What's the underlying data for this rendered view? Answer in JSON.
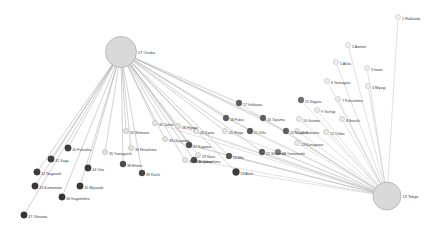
{
  "figure": {
    "type": "network-graph",
    "background_color": "#ffffff",
    "width": 440,
    "height": 231
  },
  "style": {
    "edge_color_osaka": "#9a9a9a",
    "edge_color_tokyo": "#bcbcbc",
    "hub_fill": "#d8d8d8",
    "hub_stroke": "#9b9b9b",
    "label_color": "#3a3a3a"
  },
  "hubs": [
    {
      "id": 27,
      "label": "27 Osaka",
      "x": 121,
      "y": 52,
      "r": 15.5,
      "fill": "#d9d9d9",
      "stroke": "#9e9e9e"
    },
    {
      "id": 13,
      "label": "13 Tokyo",
      "x": 387,
      "y": 196,
      "r": 14.0,
      "fill": "#d9d9d9",
      "stroke": "#9e9e9e"
    }
  ],
  "nodes": [
    {
      "id": 1,
      "label": "1 Hokkaido",
      "x": 398,
      "y": 17,
      "r": 2.6,
      "fill": "#f2f2f2",
      "stroke": "#b5b5b5",
      "label_dx": 4.0,
      "label_dy": 1.3
    },
    {
      "id": 2,
      "label": "2 Aomori",
      "x": 348,
      "y": 45,
      "r": 2.6,
      "fill": "#f0f0f0",
      "stroke": "#b2b2b2",
      "label_dx": 4.0,
      "label_dy": 1.3
    },
    {
      "id": 5,
      "label": "5 Akita",
      "x": 336,
      "y": 62,
      "r": 2.6,
      "fill": "#efefef",
      "stroke": "#b0b0b0",
      "label_dx": 4.0,
      "label_dy": 1.3
    },
    {
      "id": 3,
      "label": "3 Iwate",
      "x": 367,
      "y": 68,
      "r": 2.6,
      "fill": "#efefef",
      "stroke": "#b0b0b0",
      "label_dx": 4.0,
      "label_dy": 1.3
    },
    {
      "id": 6,
      "label": "6 Yamagata",
      "x": 327,
      "y": 81,
      "r": 2.6,
      "fill": "#ededed",
      "stroke": "#aeaeae",
      "label_dx": 4.0,
      "label_dy": 1.3
    },
    {
      "id": 4,
      "label": "4 Miyagi",
      "x": 368,
      "y": 86,
      "r": 2.6,
      "fill": "#ededed",
      "stroke": "#aeaeae",
      "label_dx": 4.0,
      "label_dy": 1.3
    },
    {
      "id": 15,
      "label": "15 Niigata",
      "x": 301,
      "y": 100,
      "r": 2.9,
      "fill": "#6e6e6e",
      "stroke": "#5d5d5d",
      "label_dx": 4.0,
      "label_dy": 1.3
    },
    {
      "id": 7,
      "label": "7 Fukushima",
      "x": 338,
      "y": 99,
      "r": 2.6,
      "fill": "#ececec",
      "stroke": "#adadad",
      "label_dx": 4.0,
      "label_dy": 1.3
    },
    {
      "id": 9,
      "label": "9 Tochigi",
      "x": 317,
      "y": 110,
      "r": 2.6,
      "fill": "#ebebeb",
      "stroke": "#acacac",
      "label_dx": 4.0,
      "label_dy": 1.3
    },
    {
      "id": 10,
      "label": "10 Gunma",
      "x": 299,
      "y": 119,
      "r": 2.6,
      "fill": "#eaeaea",
      "stroke": "#ababab",
      "label_dx": 4.0,
      "label_dy": 1.3
    },
    {
      "id": 8,
      "label": "8 Ibaraki",
      "x": 342,
      "y": 119,
      "r": 2.6,
      "fill": "#eaeaea",
      "stroke": "#ababab",
      "label_dx": 4.0,
      "label_dy": 1.3
    },
    {
      "id": 11,
      "label": "11 Saitama",
      "x": 297,
      "y": 131,
      "r": 2.6,
      "fill": "#e9e9e9",
      "stroke": "#aaaaaa",
      "label_dx": 4.0,
      "label_dy": 1.3
    },
    {
      "id": 12,
      "label": "12 Chiba",
      "x": 326,
      "y": 132,
      "r": 2.6,
      "fill": "#e9e9e9",
      "stroke": "#aaaaaa",
      "label_dx": 4.0,
      "label_dy": 1.3
    },
    {
      "id": 14,
      "label": "14 Kanagawa",
      "x": 297,
      "y": 143,
      "r": 2.6,
      "fill": "#e8e8e8",
      "stroke": "#a9a9a9",
      "label_dx": 4.0,
      "label_dy": 1.3
    },
    {
      "id": 19,
      "label": "19 Yamanashi",
      "x": 278,
      "y": 152,
      "r": 2.8,
      "fill": "#7a7a7a",
      "stroke": "#6a6a6a",
      "label_dx": 4.0,
      "label_dy": 1.3
    },
    {
      "id": 17,
      "label": "17 Ishikawa",
      "x": 239,
      "y": 103,
      "r": 2.9,
      "fill": "#5e5e5e",
      "stroke": "#4e4e4e",
      "label_dx": 4.0,
      "label_dy": 1.3
    },
    {
      "id": 16,
      "label": "16 Toyama",
      "x": 263,
      "y": 118,
      "r": 2.9,
      "fill": "#5f5f5f",
      "stroke": "#4f4f4f",
      "label_dx": 4.0,
      "label_dy": 1.3
    },
    {
      "id": 18,
      "label": "18 Fukui",
      "x": 226,
      "y": 118,
      "r": 2.9,
      "fill": "#5e5e5e",
      "stroke": "#4e4e4e",
      "label_dx": 4.0,
      "label_dy": 1.3
    },
    {
      "id": 20,
      "label": "20 Nagano",
      "x": 286,
      "y": 131,
      "r": 2.9,
      "fill": "#5f5f5f",
      "stroke": "#4f4f4f",
      "label_dx": 4.0,
      "label_dy": 1.3
    },
    {
      "id": 21,
      "label": "21 Gifu",
      "x": 250,
      "y": 131,
      "r": 2.9,
      "fill": "#585858",
      "stroke": "#484848",
      "label_dx": 4.0,
      "label_dy": 1.3
    },
    {
      "id": 25,
      "label": "25 Shiga",
      "x": 225,
      "y": 131,
      "r": 2.6,
      "fill": "#e6e6e6",
      "stroke": "#a6a6a6",
      "label_dx": 4.0,
      "label_dy": 1.3
    },
    {
      "id": 26,
      "label": "26 Kyoto",
      "x": 196,
      "y": 131,
      "r": 2.6,
      "fill": "#e6e6e6",
      "stroke": "#a6a6a6",
      "label_dx": 4.0,
      "label_dy": 1.3
    },
    {
      "id": 22,
      "label": "22 Shizuoka",
      "x": 262,
      "y": 152,
      "r": 2.9,
      "fill": "#5a5a5a",
      "stroke": "#4a4a4a",
      "label_dx": 4.0,
      "label_dy": 1.3
    },
    {
      "id": 29,
      "label": "29 Nara",
      "x": 198,
      "y": 155,
      "r": 2.6,
      "fill": "#e5e5e5",
      "stroke": "#a5a5a5",
      "label_dx": 4.0,
      "label_dy": 1.3
    },
    {
      "id": 24,
      "label": "24 Mie",
      "x": 229,
      "y": 156,
      "r": 2.9,
      "fill": "#565656",
      "stroke": "#464646",
      "label_dx": 4.0,
      "label_dy": 1.3
    },
    {
      "id": 23,
      "label": "23 Aichi",
      "x": 236,
      "y": 172,
      "r": 3.4,
      "fill": "#3d3d3d",
      "stroke": "#2d2d2d",
      "label_dx": 4.4,
      "label_dy": 1.3
    },
    {
      "id": 30,
      "label": "30 Wakayama",
      "x": 185,
      "y": 160,
      "r": 2.6,
      "fill": "#e4e4e4",
      "stroke": "#a4a4a4",
      "label_dx": 4.0,
      "label_dy": 1.3
    },
    {
      "id": 28,
      "label": "28 Hyogo",
      "x": 178,
      "y": 126,
      "r": 2.6,
      "fill": "#e4e4e4",
      "stroke": "#a4a4a4",
      "label_dx": 4.0,
      "label_dy": 1.3
    },
    {
      "id": 31,
      "label": "31 Tottori",
      "x": 155,
      "y": 123,
      "r": 2.6,
      "fill": "#e3e3e3",
      "stroke": "#a3a3a3",
      "label_dx": 4.0,
      "label_dy": 1.3
    },
    {
      "id": 33,
      "label": "33 Okayama",
      "x": 165,
      "y": 139,
      "r": 2.6,
      "fill": "#e3e3e3",
      "stroke": "#a3a3a3",
      "label_dx": 4.0,
      "label_dy": 1.3
    },
    {
      "id": 32,
      "label": "32 Shimane",
      "x": 126,
      "y": 131,
      "r": 2.6,
      "fill": "#e2e2e2",
      "stroke": "#a2a2a2",
      "label_dx": 4.0,
      "label_dy": 1.3
    },
    {
      "id": 34,
      "label": "34 Hiroshima",
      "x": 131,
      "y": 148,
      "r": 2.6,
      "fill": "#e2e2e2",
      "stroke": "#a2a2a2",
      "label_dx": 4.0,
      "label_dy": 1.3
    },
    {
      "id": 37,
      "label": "37 Kagawa",
      "x": 189,
      "y": 145,
      "r": 3.0,
      "fill": "#4d4d4d",
      "stroke": "#3d3d3d",
      "label_dx": 4.0,
      "label_dy": 1.3
    },
    {
      "id": 35,
      "label": "35 Yamaguchi",
      "x": 105,
      "y": 152,
      "r": 2.6,
      "fill": "#e1e1e1",
      "stroke": "#a1a1a1",
      "label_dx": 4.0,
      "label_dy": 1.3
    },
    {
      "id": 36,
      "label": "36 Tokushima",
      "x": 194,
      "y": 160,
      "r": 3.0,
      "fill": "#4a4a4a",
      "stroke": "#3a3a3a",
      "label_dx": 4.0,
      "label_dy": 1.3
    },
    {
      "id": 38,
      "label": "38 Ehime",
      "x": 123,
      "y": 164,
      "r": 3.0,
      "fill": "#4a4a4a",
      "stroke": "#3a3a3a",
      "label_dx": 4.0,
      "label_dy": 1.3
    },
    {
      "id": 39,
      "label": "39 Kochi",
      "x": 142,
      "y": 173,
      "r": 3.0,
      "fill": "#474747",
      "stroke": "#373737",
      "label_dx": 4.0,
      "label_dy": 1.3
    },
    {
      "id": 40,
      "label": "40 Fukuoka",
      "x": 68,
      "y": 148,
      "r": 3.2,
      "fill": "#3f3f3f",
      "stroke": "#2f2f2f",
      "label_dx": 4.2,
      "label_dy": 1.3
    },
    {
      "id": 41,
      "label": "41 Saga",
      "x": 51,
      "y": 159,
      "r": 3.2,
      "fill": "#3f3f3f",
      "stroke": "#2f2f2f",
      "label_dx": 4.2,
      "label_dy": 1.3
    },
    {
      "id": 44,
      "label": "44 Oita",
      "x": 88,
      "y": 168,
      "r": 3.2,
      "fill": "#3c3c3c",
      "stroke": "#2c2c2c",
      "label_dx": 4.2,
      "label_dy": 1.3
    },
    {
      "id": 42,
      "label": "42 Nagasaki",
      "x": 37,
      "y": 172,
      "r": 3.2,
      "fill": "#3c3c3c",
      "stroke": "#2c2c2c",
      "label_dx": 4.2,
      "label_dy": 1.3
    },
    {
      "id": 43,
      "label": "43 Kumamoto",
      "x": 35,
      "y": 186,
      "r": 3.2,
      "fill": "#393939",
      "stroke": "#292929",
      "label_dx": 4.2,
      "label_dy": 1.3
    },
    {
      "id": 45,
      "label": "45 Miyazaki",
      "x": 80,
      "y": 186,
      "r": 3.2,
      "fill": "#393939",
      "stroke": "#292929",
      "label_dx": 4.2,
      "label_dy": 1.3
    },
    {
      "id": 46,
      "label": "46 Kagoshima",
      "x": 62,
      "y": 197,
      "r": 3.2,
      "fill": "#373737",
      "stroke": "#272727",
      "label_dx": 4.2,
      "label_dy": 1.3
    },
    {
      "id": 47,
      "label": "47 Okinawa",
      "x": 24,
      "y": 215,
      "r": 3.2,
      "fill": "#353535",
      "stroke": "#252525",
      "label_dx": 4.2,
      "label_dy": 1.3
    }
  ],
  "edges": {
    "osaka_targets": [
      40,
      41,
      44,
      45,
      46,
      47,
      42,
      43,
      38,
      39,
      36,
      37,
      34,
      32,
      31,
      33,
      28,
      35,
      30,
      29,
      26,
      25,
      24,
      21,
      18,
      17,
      16,
      20,
      22,
      23
    ],
    "tokyo_targets": [
      1,
      2,
      3,
      4,
      5,
      6,
      7,
      8,
      9,
      10,
      11,
      12,
      14,
      15,
      19,
      16,
      17,
      20,
      22,
      23,
      21,
      18,
      26,
      25,
      24,
      28,
      31,
      33,
      36,
      37
    ]
  }
}
